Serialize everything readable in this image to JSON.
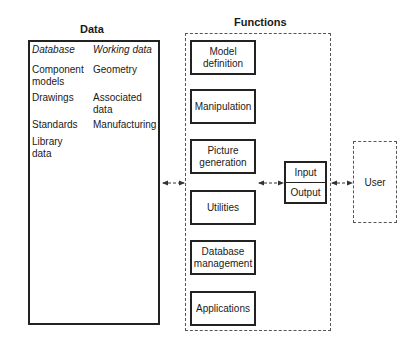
{
  "data_section": {
    "title": "Data",
    "database": {
      "heading": "Database",
      "items": [
        "Component models",
        "Drawings",
        "Standards",
        "Library data"
      ]
    },
    "working_data": {
      "heading": "Working data",
      "items": [
        "Geometry",
        "Associated data",
        "Manufacturing"
      ]
    }
  },
  "functions_section": {
    "title": "Functions",
    "boxes": [
      "Model definition",
      "Manipulation",
      "Picture generation",
      "Utilities",
      "Database management",
      "Applications"
    ]
  },
  "io_box": {
    "input": "Input",
    "output": "Output"
  },
  "user_box": {
    "label": "User"
  },
  "connections": [
    {
      "from": "Data",
      "to": "Functions",
      "type": "bidirectional-arrow"
    },
    {
      "from": "Functions",
      "to": "Input/Output",
      "type": "bidirectional-arrow"
    },
    {
      "from": "Input/Output",
      "to": "User",
      "type": "bidirectional-arrow"
    }
  ]
}
